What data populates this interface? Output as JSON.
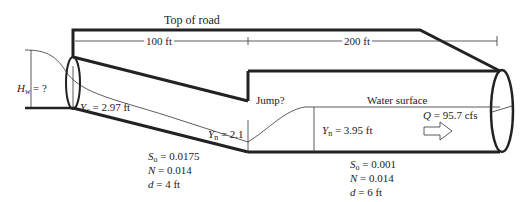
{
  "title": "Top of road",
  "dimensions": {
    "first": "100 ft",
    "second": "200 ft"
  },
  "headwater": {
    "symbol": "H",
    "sub": "w",
    "value": "= ?"
  },
  "critical_depth": {
    "symbol": "Y",
    "sub": "c",
    "value": "= 2.97 ft"
  },
  "jump_label": "Jump?",
  "water_surface_label": "Water surface",
  "normal_depth_upstream": {
    "symbol": "Y",
    "sub": "n",
    "value": "= 2.1"
  },
  "normal_depth_downstream": {
    "symbol": "Y",
    "sub": "n",
    "value": "= 3.95 ft"
  },
  "flow": {
    "symbol": "Q",
    "value": "= 95.7 cfs"
  },
  "pipe1": {
    "slope": {
      "symbol": "S",
      "sub": "o",
      "value": "= 0.0175"
    },
    "n": {
      "symbol": "N",
      "value": "= 0.014"
    },
    "d": {
      "symbol": "d",
      "value": "= 4 ft"
    }
  },
  "pipe2": {
    "slope": {
      "symbol": "S",
      "sub": "o",
      "value": "= 0.001"
    },
    "n": {
      "symbol": "N",
      "value": "= 0.014"
    },
    "d": {
      "symbol": "d",
      "value": "= 6 ft"
    }
  }
}
